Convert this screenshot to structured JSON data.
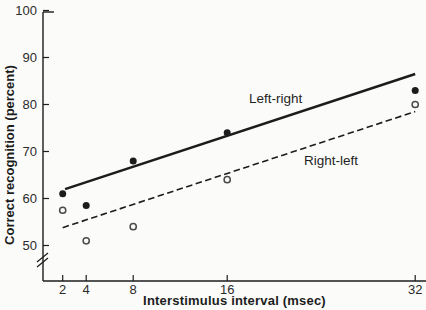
{
  "figure": {
    "background_color": "#fbfbf9",
    "ink_color": "#1c1c1c",
    "open_marker_color": "#4a4a4a"
  },
  "chart_data": {
    "type": "scatter",
    "title": "",
    "xlabel": "Interstimulus interval (msec)",
    "ylabel": "Correct recognition (percent)",
    "x_ticks": [
      2,
      4,
      8,
      16,
      32
    ],
    "y_ticks": [
      50,
      60,
      70,
      80,
      90,
      100
    ],
    "x_scale": "linear",
    "xlim": [
      2,
      32
    ],
    "ylim": [
      50,
      100
    ],
    "y_axis_break": true,
    "grid": false,
    "legend_position": "inline-labels",
    "series": [
      {
        "name": "Left-right",
        "marker": "filled-circle",
        "line_style": "solid",
        "x": [
          2,
          4,
          8,
          16,
          32
        ],
        "values": [
          61,
          58.5,
          68,
          74,
          83
        ],
        "trend_line": {
          "x1": 2.2,
          "y1": 62,
          "x2": 32,
          "y2": 86.5
        }
      },
      {
        "name": "Right-left",
        "marker": "open-circle",
        "line_style": "dashed",
        "x": [
          2,
          4,
          8,
          16,
          32
        ],
        "values": [
          57.5,
          51,
          54,
          64,
          80
        ],
        "trend_line": {
          "x1": 2,
          "y1": 53.8,
          "x2": 32,
          "y2": 78.5
        }
      }
    ]
  }
}
